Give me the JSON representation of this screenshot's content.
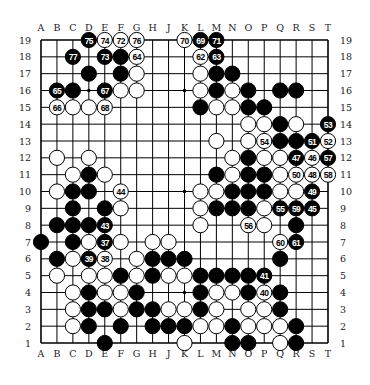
{
  "diagram": {
    "type": "go-board",
    "size": 19,
    "columns": [
      "A",
      "B",
      "C",
      "D",
      "E",
      "F",
      "G",
      "H",
      "J",
      "K",
      "L",
      "M",
      "N",
      "O",
      "P",
      "Q",
      "R",
      "S",
      "T"
    ],
    "rows": [
      19,
      18,
      17,
      16,
      15,
      14,
      13,
      12,
      11,
      10,
      9,
      8,
      7,
      6,
      5,
      4,
      3,
      2,
      1
    ],
    "hoshi": [
      "D16",
      "K16",
      "Q16",
      "D10",
      "K10",
      "Q10",
      "D4",
      "K4",
      "Q4"
    ],
    "colors": {
      "board": "#ffffff",
      "line": "#000000",
      "black": "#000000",
      "white": "#ffffff"
    },
    "stones": [
      {
        "p": "D19",
        "c": "b",
        "n": "75"
      },
      {
        "p": "E19",
        "c": "w",
        "n": "74"
      },
      {
        "p": "F19",
        "c": "w",
        "n": "72"
      },
      {
        "p": "G19",
        "c": "w",
        "n": "76"
      },
      {
        "p": "K19",
        "c": "w",
        "n": "70"
      },
      {
        "p": "L19",
        "c": "b",
        "n": "69"
      },
      {
        "p": "M19",
        "c": "b",
        "n": "71"
      },
      {
        "p": "C18",
        "c": "b",
        "n": "77"
      },
      {
        "p": "E18",
        "c": "b",
        "n": "73"
      },
      {
        "p": "F18",
        "c": "b"
      },
      {
        "p": "G18",
        "c": "w",
        "n": "64"
      },
      {
        "p": "L18",
        "c": "w",
        "n": "62"
      },
      {
        "p": "M18",
        "c": "b",
        "n": "63"
      },
      {
        "p": "D17",
        "c": "b"
      },
      {
        "p": "F17",
        "c": "b"
      },
      {
        "p": "G17",
        "c": "w"
      },
      {
        "p": "L17",
        "c": "w"
      },
      {
        "p": "M17",
        "c": "b"
      },
      {
        "p": "N17",
        "c": "b"
      },
      {
        "p": "B16",
        "c": "b",
        "n": "65"
      },
      {
        "p": "C16",
        "c": "b"
      },
      {
        "p": "E16",
        "c": "b",
        "n": "67"
      },
      {
        "p": "F16",
        "c": "w"
      },
      {
        "p": "G16",
        "c": "w"
      },
      {
        "p": "L16",
        "c": "w"
      },
      {
        "p": "M16",
        "c": "b"
      },
      {
        "p": "N16",
        "c": "w"
      },
      {
        "p": "O16",
        "c": "b"
      },
      {
        "p": "Q16",
        "c": "b"
      },
      {
        "p": "R16",
        "c": "b"
      },
      {
        "p": "B15",
        "c": "w",
        "n": "66"
      },
      {
        "p": "C15",
        "c": "w"
      },
      {
        "p": "D15",
        "c": "w"
      },
      {
        "p": "E15",
        "c": "w",
        "n": "68"
      },
      {
        "p": "L15",
        "c": "b"
      },
      {
        "p": "M15",
        "c": "w"
      },
      {
        "p": "N15",
        "c": "w"
      },
      {
        "p": "O15",
        "c": "b"
      },
      {
        "p": "P15",
        "c": "b"
      },
      {
        "p": "O14",
        "c": "w"
      },
      {
        "p": "P14",
        "c": "w"
      },
      {
        "p": "Q14",
        "c": "b"
      },
      {
        "p": "R14",
        "c": "w"
      },
      {
        "p": "T14",
        "c": "b",
        "n": "53"
      },
      {
        "p": "M13",
        "c": "w"
      },
      {
        "p": "O13",
        "c": "w"
      },
      {
        "p": "P13",
        "c": "w",
        "n": "54"
      },
      {
        "p": "Q13",
        "c": "b"
      },
      {
        "p": "R13",
        "c": "b"
      },
      {
        "p": "S13",
        "c": "b",
        "n": "51"
      },
      {
        "p": "T13",
        "c": "w",
        "n": "52"
      },
      {
        "p": "B12",
        "c": "w"
      },
      {
        "p": "D12",
        "c": "w"
      },
      {
        "p": "N12",
        "c": "w"
      },
      {
        "p": "O12",
        "c": "b"
      },
      {
        "p": "P12",
        "c": "w"
      },
      {
        "p": "Q12",
        "c": "w"
      },
      {
        "p": "R12",
        "c": "b",
        "n": "47"
      },
      {
        "p": "S12",
        "c": "w",
        "n": "46"
      },
      {
        "p": "T12",
        "c": "b",
        "n": "57"
      },
      {
        "p": "C11",
        "c": "w"
      },
      {
        "p": "D11",
        "c": "b"
      },
      {
        "p": "E11",
        "c": "w"
      },
      {
        "p": "M11",
        "c": "b"
      },
      {
        "p": "N11",
        "c": "w"
      },
      {
        "p": "O11",
        "c": "b"
      },
      {
        "p": "P11",
        "c": "b"
      },
      {
        "p": "Q11",
        "c": "w"
      },
      {
        "p": "R11",
        "c": "w",
        "n": "50"
      },
      {
        "p": "S11",
        "c": "w",
        "n": "48"
      },
      {
        "p": "T11",
        "c": "w",
        "n": "58"
      },
      {
        "p": "B10",
        "c": "w"
      },
      {
        "p": "C10",
        "c": "b"
      },
      {
        "p": "D10",
        "c": "b"
      },
      {
        "p": "F10",
        "c": "w",
        "n": "44"
      },
      {
        "p": "L10",
        "c": "w"
      },
      {
        "p": "M10",
        "c": "w"
      },
      {
        "p": "N10",
        "c": "b"
      },
      {
        "p": "O10",
        "c": "b"
      },
      {
        "p": "P10",
        "c": "b"
      },
      {
        "p": "Q10",
        "c": "w"
      },
      {
        "p": "R10",
        "c": "w"
      },
      {
        "p": "S10",
        "c": "b",
        "n": "49"
      },
      {
        "p": "C9",
        "c": "b"
      },
      {
        "p": "E9",
        "c": "b"
      },
      {
        "p": "F9",
        "c": "w"
      },
      {
        "p": "L9",
        "c": "w"
      },
      {
        "p": "M9",
        "c": "b"
      },
      {
        "p": "N9",
        "c": "b"
      },
      {
        "p": "O9",
        "c": "b"
      },
      {
        "p": "P9",
        "c": "w"
      },
      {
        "p": "Q9",
        "c": "b",
        "n": "55"
      },
      {
        "p": "R9",
        "c": "b",
        "n": "59"
      },
      {
        "p": "S9",
        "c": "b",
        "n": "45"
      },
      {
        "p": "B8",
        "c": "b"
      },
      {
        "p": "C8",
        "c": "b"
      },
      {
        "p": "D8",
        "c": "b"
      },
      {
        "p": "E8",
        "c": "b",
        "n": "43"
      },
      {
        "p": "L8",
        "c": "w"
      },
      {
        "p": "O8",
        "c": "w",
        "n": "56"
      },
      {
        "p": "P8",
        "c": "w"
      },
      {
        "p": "R8",
        "c": "b"
      },
      {
        "p": "A7",
        "c": "b"
      },
      {
        "p": "C7",
        "c": "b"
      },
      {
        "p": "D7",
        "c": "w"
      },
      {
        "p": "E7",
        "c": "b",
        "n": "37"
      },
      {
        "p": "F7",
        "c": "w"
      },
      {
        "p": "H7",
        "c": "w"
      },
      {
        "p": "J7",
        "c": "w"
      },
      {
        "p": "Q7",
        "c": "w",
        "n": "60"
      },
      {
        "p": "R7",
        "c": "b",
        "n": "61"
      },
      {
        "p": "B6",
        "c": "b"
      },
      {
        "p": "C6",
        "c": "w"
      },
      {
        "p": "D6",
        "c": "b",
        "n": "39"
      },
      {
        "p": "E6",
        "c": "w",
        "n": "38"
      },
      {
        "p": "G6",
        "c": "w"
      },
      {
        "p": "H6",
        "c": "b"
      },
      {
        "p": "J6",
        "c": "b"
      },
      {
        "p": "K6",
        "c": "b"
      },
      {
        "p": "Q6",
        "c": "b"
      },
      {
        "p": "B5",
        "c": "w"
      },
      {
        "p": "D5",
        "c": "w"
      },
      {
        "p": "E5",
        "c": "w"
      },
      {
        "p": "F5",
        "c": "b"
      },
      {
        "p": "G5",
        "c": "w"
      },
      {
        "p": "H5",
        "c": "b"
      },
      {
        "p": "J5",
        "c": "w"
      },
      {
        "p": "K5",
        "c": "w"
      },
      {
        "p": "L5",
        "c": "b"
      },
      {
        "p": "M5",
        "c": "b"
      },
      {
        "p": "N5",
        "c": "b"
      },
      {
        "p": "O5",
        "c": "b"
      },
      {
        "p": "P5",
        "c": "b",
        "n": "41"
      },
      {
        "p": "C4",
        "c": "w"
      },
      {
        "p": "D4",
        "c": "b"
      },
      {
        "p": "E4",
        "c": "w"
      },
      {
        "p": "F4",
        "c": "w"
      },
      {
        "p": "G4",
        "c": "b"
      },
      {
        "p": "L4",
        "c": "b"
      },
      {
        "p": "M4",
        "c": "w"
      },
      {
        "p": "N4",
        "c": "w"
      },
      {
        "p": "O4",
        "c": "b"
      },
      {
        "p": "P4",
        "c": "w",
        "n": "40"
      },
      {
        "p": "Q4",
        "c": "b"
      },
      {
        "p": "C3",
        "c": "w"
      },
      {
        "p": "D3",
        "c": "b"
      },
      {
        "p": "E3",
        "c": "b"
      },
      {
        "p": "F3",
        "c": "w"
      },
      {
        "p": "G3",
        "c": "b"
      },
      {
        "p": "H3",
        "c": "b"
      },
      {
        "p": "J3",
        "c": "w"
      },
      {
        "p": "K3",
        "c": "w"
      },
      {
        "p": "L3",
        "c": "b"
      },
      {
        "p": "M3",
        "c": "w"
      },
      {
        "p": "O3",
        "c": "w"
      },
      {
        "p": "P3",
        "c": "w"
      },
      {
        "p": "Q3",
        "c": "b"
      },
      {
        "p": "C2",
        "c": "w"
      },
      {
        "p": "D2",
        "c": "b"
      },
      {
        "p": "F2",
        "c": "b"
      },
      {
        "p": "H2",
        "c": "b"
      },
      {
        "p": "J2",
        "c": "b"
      },
      {
        "p": "K2",
        "c": "b"
      },
      {
        "p": "L2",
        "c": "w"
      },
      {
        "p": "M2",
        "c": "w"
      },
      {
        "p": "N2",
        "c": "b"
      },
      {
        "p": "O2",
        "c": "w"
      },
      {
        "p": "P2",
        "c": "w"
      },
      {
        "p": "Q2",
        "c": "w"
      },
      {
        "p": "R2",
        "c": "b"
      },
      {
        "p": "E1",
        "c": "b"
      },
      {
        "p": "K1",
        "c": "w"
      },
      {
        "p": "N1",
        "c": "b"
      },
      {
        "p": "O1",
        "c": "b"
      },
      {
        "p": "Q1",
        "c": "w"
      },
      {
        "p": "R1",
        "c": "b"
      }
    ]
  }
}
